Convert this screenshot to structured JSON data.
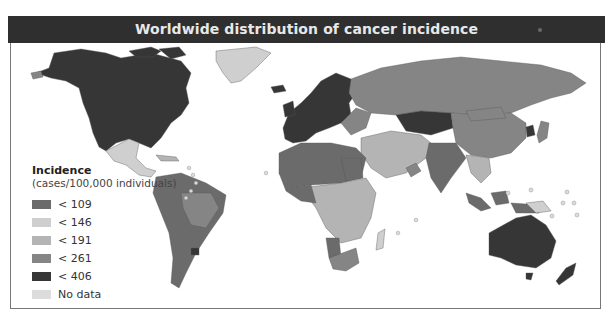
{
  "title": "Worldwide distribution of cancer incidence",
  "legend": {
    "title": "Incidence",
    "subtitle": "(cases/100,000 individuals)",
    "items": [
      {
        "label": "< 109",
        "color": "#6b6b6b"
      },
      {
        "label": "< 146",
        "color": "#cfcfcf"
      },
      {
        "label": "< 191",
        "color": "#b4b4b4"
      },
      {
        "label": "< 261",
        "color": "#858585"
      },
      {
        "label": "< 406",
        "color": "#363636"
      },
      {
        "label": "No data",
        "color": "#dcdcdc"
      }
    ]
  },
  "colors": {
    "c109": "#6b6b6b",
    "c146": "#cfcfcf",
    "c191": "#b4b4b4",
    "c261": "#858585",
    "c406": "#363636",
    "nodata": "#dcdcdc",
    "title_bar": "#2f2f2f",
    "border": "#777777"
  }
}
